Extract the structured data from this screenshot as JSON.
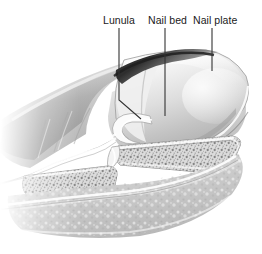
{
  "figure": {
    "kind": "anatomical-illustration",
    "style": "grayscale airbrush / stipple medical illustration",
    "width": 262,
    "height": 254,
    "background_color": "#ffffff"
  },
  "annotations": {
    "label_color": "#1a1a1a",
    "leader_color": "#333333",
    "items": [
      {
        "id": "lunula",
        "label": "Lunula",
        "label_x": 103,
        "label_y": 14,
        "leader": {
          "type": "elbow",
          "points": [
            [
              119,
              28
            ],
            [
              119,
              100
            ],
            [
              141,
              119
            ]
          ]
        }
      },
      {
        "id": "nail-bed",
        "label": "Nail bed",
        "label_x": 148,
        "label_y": 14,
        "leader": {
          "type": "straight",
          "points": [
            [
              165,
              28
            ],
            [
              165,
              116
            ]
          ]
        }
      },
      {
        "id": "nail-plate",
        "label": "Nail plate",
        "label_x": 193,
        "label_y": 14,
        "leader": {
          "type": "straight",
          "points": [
            [
              212,
              28
            ],
            [
              212,
              71
            ]
          ]
        }
      }
    ]
  },
  "artwork": {
    "palette": {
      "white": "#ffffff",
      "highlight": "#f6f6f6",
      "light_gray": "#e3e3e3",
      "mid_gray": "#c2c2c2",
      "tone_gray": "#a8a8a8",
      "dark_gray": "#7a7a7a",
      "deep_gray": "#4a4a4a",
      "shadow": "#2c2c2c",
      "outline": "#555555"
    },
    "structures": [
      {
        "name": "skin-dorsum",
        "note": "upper finger skin surface, smooth airbrushed grays, fades at left edge"
      },
      {
        "name": "proximal-nail-fold",
        "note": "dark curved shadow band above lunula at top of nail"
      },
      {
        "name": "nail-plate",
        "note": "broad curved glossy plate sweeping to fingertip apex at right"
      },
      {
        "name": "nail-bed",
        "note": "pale tissue layer beneath the nail plate"
      },
      {
        "name": "lunula",
        "note": "crescent region at proximal nail, lighter than nail bed"
      },
      {
        "name": "eponychium-cuticle",
        "note": "hooked white fold of skin curling under the nail root"
      },
      {
        "name": "distal-phalanx",
        "note": "tapering bone with trabecular stippled cancellous texture"
      },
      {
        "name": "middle-phalanx",
        "note": "left bone segment with stippled texture, joint gap between"
      },
      {
        "name": "interphalangeal-joint",
        "note": "narrow light gap separating the two phalanges"
      },
      {
        "name": "volar-pulp",
        "note": "fingertip pad tissue below the bone, speckled soft tone"
      },
      {
        "name": "volar-skin-outline",
        "note": "thin light line tracing the underside skin contour"
      },
      {
        "name": "flexor-crease",
        "note": "wavy contour line along the lower skin boundary at left"
      }
    ]
  }
}
